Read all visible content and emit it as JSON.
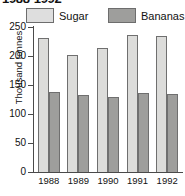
{
  "chart_data": {
    "type": "bar",
    "title": "1988-1992",
    "categories": [
      "1988",
      "1989",
      "1990",
      "1991",
      "1992"
    ],
    "series": [
      {
        "name": "Sugar",
        "values": [
          231,
          202,
          214,
          236,
          235
        ],
        "color": "#dcdcda"
      },
      {
        "name": "Bananas",
        "values": [
          138,
          133,
          129,
          137,
          135
        ],
        "color": "#9e9e9c"
      }
    ],
    "xlabel": "",
    "ylabel": "Thousand tonnes",
    "ylim": [
      0,
      250
    ],
    "yticks": [
      250,
      200,
      150,
      100,
      50,
      0
    ],
    "grid": false,
    "legend_position": "top"
  },
  "legend": {
    "sugar_label": "Sugar",
    "bananas_label": "Bananas"
  },
  "axis": {
    "ylabel": "Thousand tonnes",
    "ticks": [
      "250",
      "200",
      "150",
      "100",
      "50",
      "0"
    ],
    "years": [
      "1988",
      "1989",
      "1990",
      "1991",
      "1992"
    ]
  }
}
